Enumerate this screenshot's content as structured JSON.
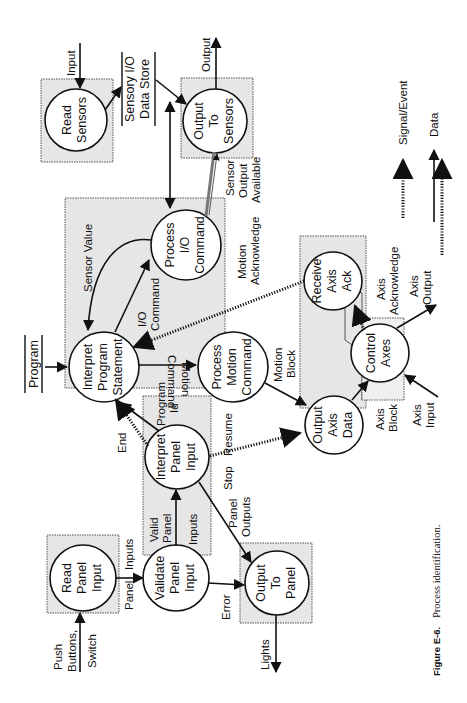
{
  "figure": {
    "caption_label": "Figure E-6.",
    "caption_text": "Process identification."
  },
  "processes": {
    "read_sensors": [
      "Read",
      "Sensors"
    ],
    "output_to_sensors": [
      "Output",
      "To",
      "Sensors"
    ],
    "process_io_command": [
      "Process",
      "I/O",
      "Command"
    ],
    "interpret_program_statement": [
      "Interpret",
      "Program",
      "Statement"
    ],
    "process_motion_command": [
      "Process",
      "Motion",
      "Command"
    ],
    "receive_axis_ack": [
      "Receive",
      "Axis",
      "Ack"
    ],
    "output_axis_data": [
      "Output",
      "Axis",
      "Data"
    ],
    "control_axes": [
      "Control",
      "Axes"
    ],
    "interpret_panel_input": [
      "Interpret",
      "Panel",
      "Input"
    ],
    "read_panel_input": [
      "Read",
      "Panel",
      "Input"
    ],
    "validate_panel_input": [
      "Validate",
      "Panel",
      "Input"
    ],
    "output_to_panel": [
      "Output",
      "To",
      "Panel"
    ]
  },
  "stores": {
    "sensory_io": [
      "Sensory I/O",
      "Data Store"
    ],
    "program": [
      "Program"
    ]
  },
  "flows": {
    "input": "Input",
    "output": "Output",
    "sensor_output_available": [
      "Sensor",
      "Output",
      "Available"
    ],
    "sensor_value": "Sensor Value",
    "io_command": [
      "I/O",
      "Command"
    ],
    "motion_command": [
      "Motion",
      "Command"
    ],
    "motion_acknowledge": [
      "Motion",
      "Acknowledge"
    ],
    "motion_block": [
      "Motion",
      "Block"
    ],
    "axis_acknowledge": [
      "Axis",
      "Acknowledge"
    ],
    "axis_output": [
      "Axis",
      "Output"
    ],
    "axis_block": [
      "Axis",
      "Block"
    ],
    "axis_input": [
      "Axis",
      "Input"
    ],
    "end": "End",
    "program_id": [
      "Program",
      "Id"
    ],
    "stop": "Stop",
    "resume": "Resume",
    "panel_outputs": [
      "Panel",
      "Outputs"
    ],
    "valid_panel_inputs": [
      "Valid",
      "Panel",
      "Inputs"
    ],
    "panel_inputs": [
      "Panel",
      "Inputs"
    ],
    "error": "Error",
    "lights": "Lights",
    "push_buttons_switch": [
      "Push",
      "Buttons,",
      "Switch"
    ]
  },
  "legend": {
    "signal_event": "Signal/Event",
    "data": "Data"
  }
}
